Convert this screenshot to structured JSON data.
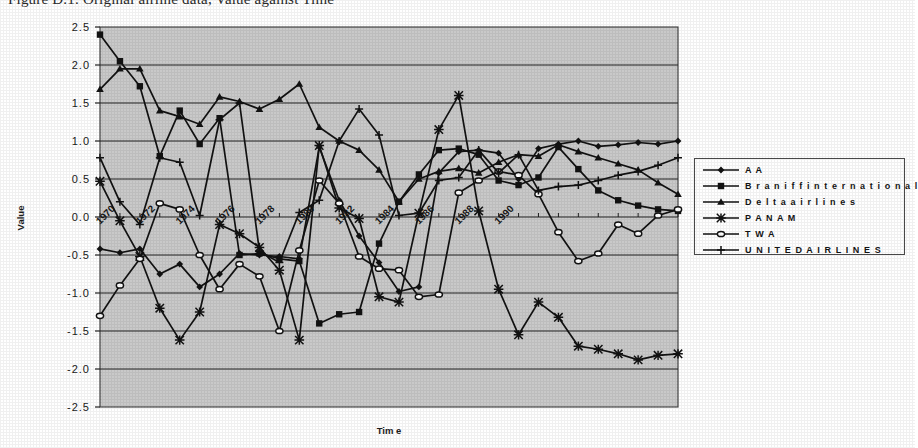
{
  "caption": "Figure D.1. Original airline data, Value against Time",
  "chart_data": {
    "type": "line",
    "title": "",
    "xlabel": "Tim e",
    "ylabel": "Value",
    "ylim": [
      -2.5,
      2.5
    ],
    "ytick_labels": [
      "2.5",
      "2.0",
      "1.5",
      "1.0",
      "0.5",
      "0.0",
      "-0.5",
      "-1.0",
      "-1.5",
      "-2.0",
      "-2.5"
    ],
    "ytick_values": [
      2.5,
      2.0,
      1.5,
      1.0,
      0.5,
      0.0,
      -0.5,
      -1.0,
      -1.5,
      -2.0,
      -2.5
    ],
    "grid": true,
    "grid_axis": "y",
    "plot_background": "#c9c9c9",
    "legend_position": "right",
    "x_label_rotation": -45,
    "x": [
      1970,
      1971,
      1972,
      1973,
      1974,
      1975,
      1976,
      1977,
      1978,
      1979,
      1980,
      1981,
      1982,
      1983,
      1984,
      1985,
      1986,
      1987,
      1988,
      1989,
      1990,
      1991,
      1992,
      1993,
      1994,
      1995,
      1996,
      1997,
      1998,
      1999
    ],
    "xtick_labels": [
      "1970",
      "1972",
      "1974",
      "1976",
      "1978",
      "1980",
      "1982",
      "1984",
      "1986",
      "1988",
      "1990"
    ],
    "xtick_x": [
      1970,
      1972,
      1974,
      1976,
      1978,
      1980,
      1982,
      1984,
      1986,
      1988,
      1990
    ],
    "series": [
      {
        "name": "AA",
        "marker": "diamond",
        "values": [
          -0.42,
          -0.47,
          -0.42,
          -0.75,
          -0.62,
          -0.92,
          -0.75,
          -0.48,
          -0.5,
          -0.52,
          -0.55,
          0.92,
          0.22,
          -0.25,
          -0.6,
          -0.98,
          -0.92,
          0.58,
          0.86,
          0.88,
          0.84,
          0.5,
          0.9,
          0.96,
          1.0,
          0.93,
          0.95,
          0.98,
          0.96,
          1.0
        ]
      },
      {
        "name": "Braniff international",
        "marker": "square",
        "values": [
          2.4,
          2.05,
          1.72,
          0.8,
          1.4,
          0.96,
          1.3,
          -0.5,
          -0.48,
          -0.55,
          -0.58,
          -1.4,
          -1.28,
          -1.25,
          -0.35,
          0.2,
          0.56,
          0.88,
          0.9,
          0.82,
          0.48,
          0.42,
          0.52,
          0.92,
          0.63,
          0.35,
          0.22,
          0.15,
          0.1,
          0.08
        ]
      },
      {
        "name": "Delta airlines",
        "marker": "triangle",
        "values": [
          1.68,
          1.95,
          1.95,
          1.4,
          1.32,
          1.22,
          1.58,
          1.52,
          1.42,
          1.55,
          1.75,
          1.18,
          1.0,
          0.88,
          0.62,
          0.2,
          0.5,
          0.6,
          0.64,
          0.58,
          0.72,
          0.82,
          0.8,
          0.95,
          0.86,
          0.78,
          0.7,
          0.62,
          0.45,
          0.3
        ]
      },
      {
        "name": "PAN AM",
        "marker": "star",
        "values": [
          0.47,
          -0.05,
          -0.52,
          -1.2,
          -1.62,
          -1.25,
          -0.1,
          -0.22,
          -0.4,
          -0.7,
          -1.62,
          0.94,
          0.12,
          -0.02,
          -1.05,
          -1.12,
          0.05,
          1.15,
          1.6,
          0.08,
          -0.95,
          -1.55,
          -1.12,
          -1.32,
          -1.7,
          -1.74,
          -1.8,
          -1.88,
          -1.82,
          -1.8
        ]
      },
      {
        "name": "TWA",
        "marker": "circle",
        "values": [
          -1.3,
          -0.9,
          -0.55,
          0.18,
          0.1,
          -0.5,
          -0.95,
          -0.62,
          -0.78,
          -1.5,
          -0.44,
          0.48,
          0.18,
          -0.52,
          -0.68,
          -0.7,
          -1.05,
          -1.02,
          0.32,
          0.48,
          0.6,
          0.55,
          0.3,
          -0.2,
          -0.58,
          -0.48,
          -0.1,
          -0.22,
          0.02,
          0.1
        ]
      },
      {
        "name": "UNITED AIRLINES",
        "marker": "plus",
        "values": [
          0.78,
          0.2,
          -0.1,
          0.78,
          0.72,
          0.02,
          1.28,
          1.5,
          -0.45,
          -0.6,
          0.06,
          0.22,
          1.0,
          1.42,
          1.08,
          0.02,
          0.05,
          0.48,
          0.52,
          0.88,
          0.58,
          0.82,
          0.35,
          0.4,
          0.42,
          0.48,
          0.55,
          0.6,
          0.68,
          0.78
        ]
      }
    ]
  },
  "legend": {
    "items": [
      {
        "label": "A A",
        "marker": "diamond"
      },
      {
        "label": "B r a n i f f  i n t e r n a t i o n a l",
        "marker": "square"
      },
      {
        "label": "D e l t a  a i r l i n e s",
        "marker": "triangle"
      },
      {
        "label": "P A N  A M",
        "marker": "star"
      },
      {
        "label": "T W A",
        "marker": "circle"
      },
      {
        "label": "U N I T E D  A I R L I N E S",
        "marker": "plus"
      }
    ]
  }
}
